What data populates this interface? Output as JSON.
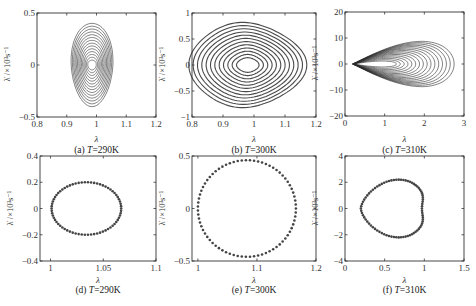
{
  "figure": {
    "ylabel": "λ̇ /×10³s⁻¹",
    "xlabel": "λ"
  },
  "chart_data": [
    {
      "id": "a",
      "type": "line",
      "title": "(a) T=290K",
      "caption_prefix": "(a) ",
      "caption_T": "T",
      "caption_value": "=290K",
      "xlabel": "λ",
      "ylabel": "λ̇ /×10³s⁻¹",
      "xlim": [
        0.8,
        1.2
      ],
      "ylim": [
        -0.5,
        0.5
      ],
      "xticks": [
        "0.8",
        "0.9",
        "1",
        "1.1",
        "1.2"
      ],
      "yticks": [
        "-0.5",
        "0",
        "0.5"
      ],
      "shape": "spiral_ellipse",
      "center": [
        0.985,
        0.0
      ],
      "outer_radius": [
        0.07,
        0.4
      ],
      "inner_radius": [
        0.01,
        0.02
      ],
      "rings": 14
    },
    {
      "id": "b",
      "type": "line",
      "title": "(b) T=300K",
      "caption_prefix": "(b) ",
      "caption_T": "T",
      "caption_value": "=300K",
      "xlabel": "λ",
      "ylabel": "λ̇ /×10³s⁻¹",
      "xlim": [
        0.8,
        1.2
      ],
      "ylim": [
        -1,
        1
      ],
      "xticks": [
        "0.8",
        "0.9",
        "1",
        "1.1",
        "1.2"
      ],
      "yticks": [
        "-1",
        "-0.5",
        "0",
        "0.5",
        "1"
      ],
      "shape": "spiral_rounded_triangle",
      "center": [
        0.98,
        0.0
      ],
      "outer_radius": [
        0.17,
        0.82
      ],
      "inner_radius": [
        0.02,
        0.08
      ],
      "rings": 12
    },
    {
      "id": "c",
      "type": "line",
      "title": "(c) T=310K",
      "caption_prefix": "(c) ",
      "caption_T": "T",
      "caption_value": "=310K",
      "xlabel": "λ",
      "ylabel": "λ̇ /×10³s⁻¹",
      "xlim": [
        0,
        3
      ],
      "ylim": [
        -20,
        20
      ],
      "xticks": [
        "0",
        "1",
        "2",
        "3"
      ],
      "yticks": [
        "-20",
        "-10",
        "0",
        "10",
        "20"
      ],
      "shape": "spiral_teardrop",
      "tip": [
        0.2,
        0.0
      ],
      "outer_right": 2.75,
      "outer_half_height": 11,
      "rings": 16
    },
    {
      "id": "d",
      "type": "scatter",
      "title": "(d) T=290K",
      "caption_prefix": "(d) ",
      "caption_T": "T",
      "caption_value": "=290K",
      "xlabel": "λ",
      "ylabel": "λ̇ /×10³s⁻¹",
      "xlim": [
        0.99,
        1.1
      ],
      "ylim": [
        -0.4,
        0.4
      ],
      "xticks": [
        "1",
        "1.05",
        "1.1"
      ],
      "yticks": [
        "-0.4",
        "-0.2",
        "0",
        "0.2",
        "0.4"
      ],
      "shape": "ellipse",
      "center": [
        1.034,
        0.0
      ],
      "radius": [
        0.033,
        0.2
      ],
      "points": 70
    },
    {
      "id": "e",
      "type": "scatter",
      "title": "(e) T=300K",
      "caption_prefix": "(e) ",
      "caption_T": "T",
      "caption_value": "=300K",
      "xlabel": "λ",
      "ylabel": "λ̇ /×10³s⁻¹",
      "xlim": [
        0.99,
        1.2
      ],
      "ylim": [
        -0.5,
        0.5
      ],
      "xticks": [
        "1",
        "1.1",
        "1.2"
      ],
      "yticks": [
        "-0.5",
        "0",
        "0.5"
      ],
      "shape": "circle",
      "center": [
        1.083,
        0.0
      ],
      "radius": [
        0.083,
        0.46
      ],
      "points": 75
    },
    {
      "id": "f",
      "type": "scatter",
      "title": "(f) T=310K",
      "caption_prefix": "(f) ",
      "caption_T": "T",
      "caption_value": "=310K",
      "xlabel": "λ",
      "ylabel": "λ̇ /×10³s⁻¹",
      "xlim": [
        0,
        1.5
      ],
      "ylim": [
        -4,
        4
      ],
      "xticks": [
        "0",
        "0.5",
        "1",
        "1.5"
      ],
      "yticks": [
        "-4",
        "-2",
        "0",
        "2",
        "4"
      ],
      "shape": "heart",
      "tip": [
        0.2,
        0.0
      ],
      "right": 1.03,
      "half_height": 2.2,
      "points": 80
    }
  ]
}
